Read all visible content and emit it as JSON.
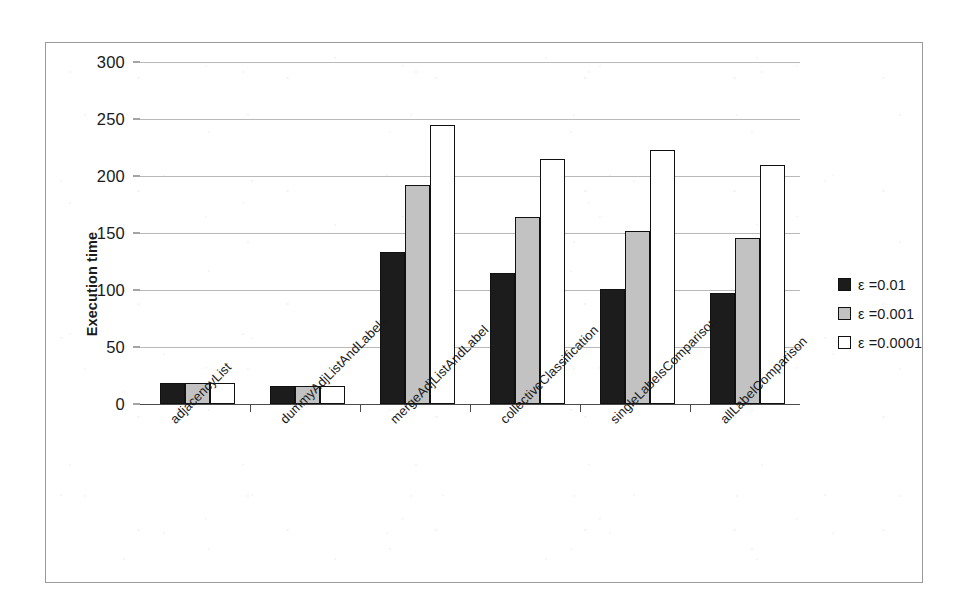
{
  "chart_data": {
    "type": "bar",
    "title": "",
    "xlabel": "",
    "ylabel": "Execution time",
    "ylim": [
      0,
      300
    ],
    "ytick_step": 50,
    "yticks": [
      "300",
      "250",
      "200",
      "150",
      "100",
      "50",
      "0"
    ],
    "grid": true,
    "legend_position": "right",
    "categories": [
      "adjacencyList",
      "dummyAdjListAndLabels",
      "mergeAdjListAndLabel",
      "collectiveClassification",
      "singleLabelsComparison",
      "allLabelComparison"
    ],
    "series": [
      {
        "name": "ε =0.01",
        "color": "#1c1c1c",
        "values": [
          18,
          16,
          133,
          115,
          101,
          97
        ]
      },
      {
        "name": "ε =0.001",
        "color": "#c2c2c2",
        "values": [
          18,
          16,
          192,
          164,
          152,
          146
        ]
      },
      {
        "name": "ε =0.0001",
        "color": "#ffffff",
        "values": [
          18,
          16,
          245,
          215,
          223,
          210
        ]
      }
    ]
  },
  "legend": {
    "items": [
      {
        "label": "ε =0.01"
      },
      {
        "label": "ε =0.001"
      },
      {
        "label": "ε =0.0001"
      }
    ]
  }
}
